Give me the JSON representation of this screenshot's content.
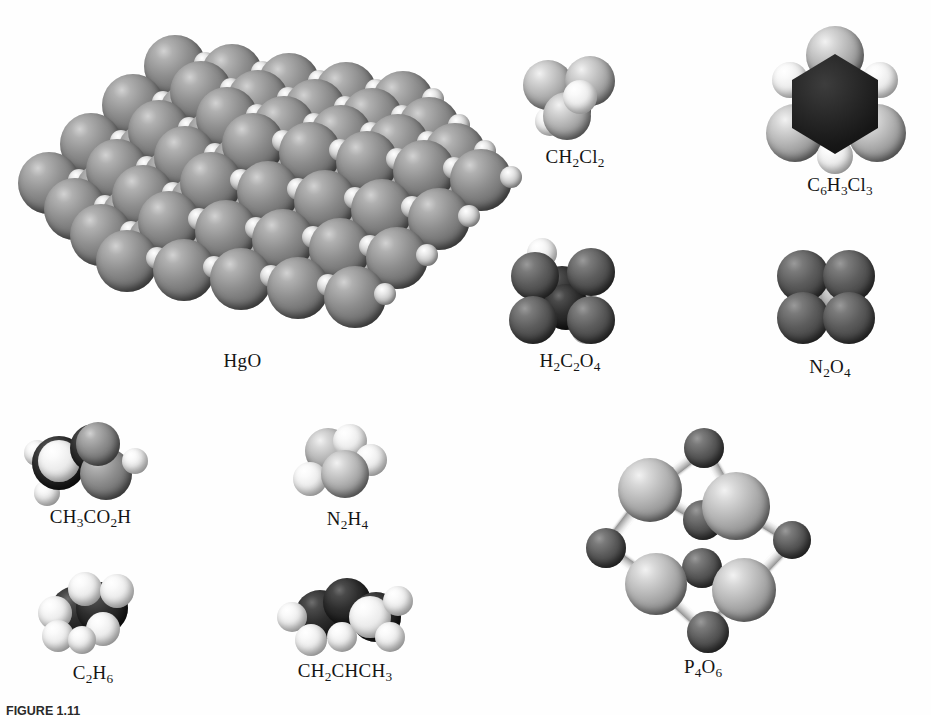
{
  "figure": {
    "caption_prefix": "FIGURE",
    "caption_number": "1.11",
    "caption_text": ""
  },
  "molecules": [
    {
      "id": "hgo",
      "label_html": "HgO",
      "formula": "HgO",
      "name": "mercury(II) oxide",
      "model_type": "space-filling-crystal-lattice",
      "atoms": [
        "Hg",
        "O"
      ]
    },
    {
      "id": "ch2cl2",
      "label_html": "CH<sub>2</sub>Cl<sub>2</sub>",
      "formula": "CH2Cl2",
      "name": "dichloromethane",
      "model_type": "space-filling",
      "atoms": [
        "C",
        "H",
        "Cl"
      ]
    },
    {
      "id": "c6h3cl3",
      "label_html": "C<sub>6</sub>H<sub>3</sub>Cl<sub>3</sub>",
      "formula": "C6H3Cl3",
      "name": "1,3,5-trichlorobenzene",
      "model_type": "space-filling",
      "atoms": [
        "C",
        "H",
        "Cl"
      ]
    },
    {
      "id": "h2c2o4",
      "label_html": "H<sub>2</sub>C<sub>2</sub>O<sub>4</sub>",
      "formula": "H2C2O4",
      "name": "oxalic acid",
      "model_type": "space-filling",
      "atoms": [
        "H",
        "C",
        "O"
      ]
    },
    {
      "id": "n2o4",
      "label_html": "N<sub>2</sub>O<sub>4</sub>",
      "formula": "N2O4",
      "name": "dinitrogen tetroxide",
      "model_type": "space-filling",
      "atoms": [
        "N",
        "O"
      ]
    },
    {
      "id": "ch3co2h",
      "label_html": "CH<sub>3</sub>CO<sub>2</sub>H",
      "formula": "CH3CO2H",
      "name": "acetic acid",
      "model_type": "space-filling",
      "atoms": [
        "C",
        "H",
        "O"
      ]
    },
    {
      "id": "n2h4",
      "label_html": "N<sub>2</sub>H<sub>4</sub>",
      "formula": "N2H4",
      "name": "hydrazine",
      "model_type": "space-filling",
      "atoms": [
        "N",
        "H"
      ]
    },
    {
      "id": "c2h6",
      "label_html": "C<sub>2</sub>H<sub>6</sub>",
      "formula": "C2H6",
      "name": "ethane",
      "model_type": "space-filling",
      "atoms": [
        "C",
        "H"
      ]
    },
    {
      "id": "ch2chch3",
      "label_html": "CH<sub>2</sub>CHCH<sub>3</sub>",
      "formula": "CH2CHCH3",
      "name": "propene",
      "model_type": "space-filling",
      "atoms": [
        "C",
        "H"
      ]
    },
    {
      "id": "p4o6",
      "label_html": "P<sub>4</sub>O<sub>6</sub>",
      "formula": "P4O6",
      "name": "phosphorus trioxide",
      "model_type": "ball-and-stick",
      "atoms": [
        "P",
        "O"
      ]
    }
  ],
  "colors": {
    "background": "#ffffff",
    "atom_light": "#b5b5b5",
    "atom_medium": "#8e8e8e",
    "atom_dark": "#5c5c5c",
    "atom_black": "#1d1d1d",
    "atom_white": "#ececec",
    "label_text": "#151515"
  }
}
